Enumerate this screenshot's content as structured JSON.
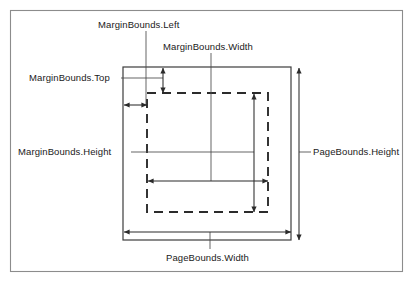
{
  "diagram": {
    "colors": {
      "frame": "#8c8c8c",
      "page_rect": "#3d3d3d",
      "margin_rect": "#2b2b2b",
      "dimension": "#2b2b2b",
      "leader": "#4a4a4a",
      "text": "#1a1a1a",
      "background": "#ffffff"
    },
    "labels": {
      "margin_left": "MarginBounds.Left",
      "margin_width": "MarginBounds.Width",
      "margin_top": "MarginBounds.Top",
      "margin_height": "MarginBounds.Height",
      "page_height": "PageBounds.Height",
      "page_width": "PageBounds.Width"
    },
    "shapes": {
      "outer_frame": {
        "x": 10,
        "y": 10,
        "width": 393,
        "height": 262,
        "style": "solid"
      },
      "page_bounds_rect": {
        "x": 123,
        "y": 67,
        "width": 168,
        "height": 173,
        "style": "solid"
      },
      "margin_bounds_rect": {
        "x": 147,
        "y": 93,
        "width": 121,
        "height": 119,
        "style": "dashed"
      }
    },
    "dimensions": [
      {
        "name": "MarginBounds.Left",
        "orientation": "horizontal",
        "from": 123,
        "to": 147,
        "at": 105
      },
      {
        "name": "MarginBounds.Top",
        "orientation": "vertical",
        "from": 67,
        "to": 93,
        "at": 163
      },
      {
        "name": "MarginBounds.Width",
        "orientation": "horizontal",
        "from": 147,
        "to": 268,
        "at": 181
      },
      {
        "name": "MarginBounds.Height",
        "orientation": "vertical",
        "from": 93,
        "to": 212,
        "at": 254
      },
      {
        "name": "PageBounds.Width",
        "orientation": "horizontal",
        "from": 123,
        "to": 291,
        "at": 232
      },
      {
        "name": "PageBounds.Height",
        "orientation": "vertical",
        "from": 67,
        "to": 240,
        "at": 299
      }
    ]
  }
}
